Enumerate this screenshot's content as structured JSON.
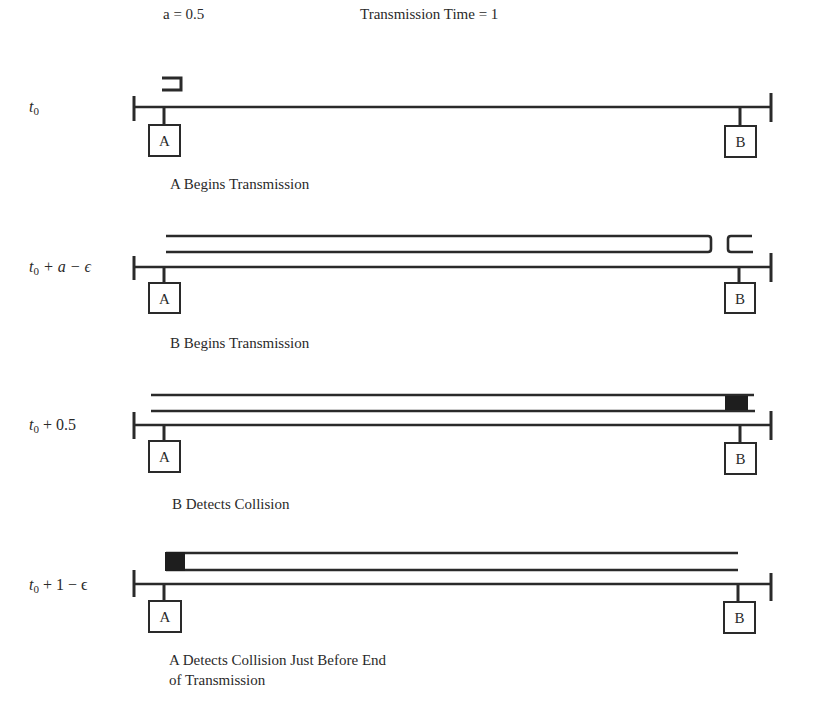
{
  "header": {
    "param_a": "a = 0.5",
    "transmission_time": "Transmission Time = 1"
  },
  "stations": {
    "left": "A",
    "right": "B"
  },
  "panels": [
    {
      "time_label": {
        "base": "t",
        "sub": "0",
        "suffix": ""
      },
      "caption": "A Begins Transmission"
    },
    {
      "time_label": {
        "base": "t",
        "sub": "0",
        "suffix": " + a − ϵ"
      },
      "caption": "B Begins Transmission"
    },
    {
      "time_label": {
        "base": "t",
        "sub": "0",
        "suffix": " + 0.5"
      },
      "caption": "B Detects Collision"
    },
    {
      "time_label": {
        "base": "t",
        "sub": "0",
        "suffix": " + 1 − ϵ"
      },
      "caption": "A Detects Collision Just Before End",
      "caption_line2": "of Transmission"
    }
  ],
  "colors": {
    "ink": "#2a2a2a",
    "background": "#ffffff"
  }
}
